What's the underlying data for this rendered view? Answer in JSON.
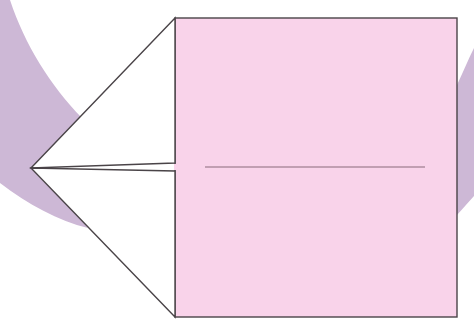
{
  "diagram": {
    "title": "",
    "colors": {
      "background": "#ffffff",
      "paper_front": "#f9d3ea",
      "paper_back": "#ffffff",
      "arrow": "#cdb8d6",
      "outline": "#4a4448",
      "crease": "#8a6a7a"
    },
    "elements": {
      "square": {
        "x": 175,
        "y": 18,
        "width": 282,
        "height": 299
      },
      "flap_tip": {
        "x": 31,
        "y": 168
      },
      "flap_notch_top_y": 163,
      "flap_notch_bottom_y": 171,
      "crease": {
        "x1": 205,
        "y1": 167,
        "x2": 425,
        "y2": 167
      }
    }
  }
}
